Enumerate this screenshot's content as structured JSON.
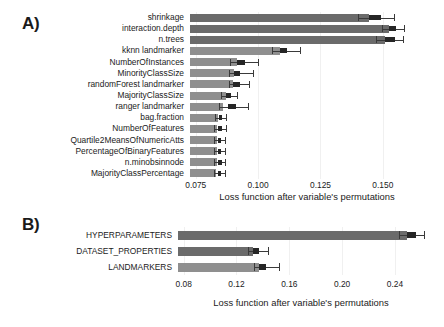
{
  "figure": {
    "background": "#ffffff",
    "panels": [
      "A)",
      "B)"
    ]
  },
  "panelA": {
    "letter": "A)",
    "xlabel": "Loss function after variable's permutations",
    "ticks": [
      "0.075",
      "0.100",
      "0.125",
      "0.150"
    ],
    "tickvals": [
      0.075,
      0.1,
      0.125,
      0.15
    ],
    "labels": [
      "shrinkage",
      "interaction.depth",
      "n.trees",
      "kknn landmarker",
      "NumberOfInstances",
      "MinorityClassSize",
      "randomForest landmarker",
      "MajorityClassSize",
      "ranger landmarker",
      "bag.fraction",
      "NumberOfFeatures",
      "Quartile2MeansOfNumericAtts",
      "PercentageOfBinaryFeatures",
      "n.minobsinnode",
      "MajorityClassPercentage"
    ]
  },
  "panelB": {
    "letter": "B)",
    "xlabel": "Loss function after variable's permutations",
    "ticks": [
      "0.08",
      "0.12",
      "0.16",
      "0.20",
      "0.24"
    ],
    "tickvals": [
      0.08,
      0.12,
      0.16,
      0.2,
      0.24
    ],
    "labels": [
      "HYPERPARAMETERS",
      "DATASET_PROPERTIES",
      "LANDMARKERS"
    ]
  },
  "colors": {
    "bar_dark": "#6b6b6b",
    "bar_light": "#8f8f8f",
    "box": "#262626",
    "whisker": "#3a3a3a",
    "grid": "#f0f0f0",
    "text": "#1b1b1b"
  },
  "chart_data": [
    {
      "type": "bar",
      "orientation": "horizontal",
      "title": "A)",
      "xlabel": "Loss function after variable's permutations",
      "ylabel": "",
      "xlim": [
        0.0727,
        0.1665
      ],
      "grid": true,
      "legend": null,
      "categories": [
        "shrinkage",
        "interaction.depth",
        "n.trees",
        "kknn landmarker",
        "NumberOfInstances",
        "MinorityClassSize",
        "randomForest landmarker",
        "MajorityClassSize",
        "ranger landmarker",
        "bag.fraction",
        "NumberOfFeatures",
        "Quartile2MeansOfNumericAtts",
        "PercentageOfBinaryFeatures",
        "n.minobsinnode",
        "MajorityClassPercentage"
      ],
      "values": [
        0.1446,
        0.1525,
        0.1509,
        0.1086,
        0.0916,
        0.0903,
        0.0901,
        0.087,
        0.086,
        0.0838,
        0.0836,
        0.0835,
        0.0834,
        0.0834,
        0.0833
      ],
      "box_low": [
        0.1446,
        0.1525,
        0.1509,
        0.1086,
        0.0916,
        0.0903,
        0.0901,
        0.087,
        0.088,
        0.0843,
        0.0841,
        0.084,
        0.0839,
        0.084,
        0.0839
      ],
      "box_high": [
        0.1493,
        0.1553,
        0.1548,
        0.1117,
        0.0949,
        0.0928,
        0.0928,
        0.0892,
        0.0913,
        0.0856,
        0.0854,
        0.0852,
        0.0852,
        0.0854,
        0.0853
      ],
      "whisker_low": [
        0.1399,
        0.1498,
        0.1474,
        0.1056,
        0.0886,
        0.0884,
        0.0884,
        0.0853,
        0.0845,
        0.0826,
        0.0825,
        0.0824,
        0.0824,
        0.0824,
        0.0823
      ],
      "whisker_high": [
        0.1545,
        0.1583,
        0.1579,
        0.1166,
        0.0999,
        0.0978,
        0.0963,
        0.0914,
        0.0958,
        0.0872,
        0.087,
        0.0867,
        0.0866,
        0.0868,
        0.0867
      ],
      "bar_group": [
        "dark",
        "dark",
        "dark",
        "light",
        "light",
        "light",
        "light",
        "light",
        "light",
        "light",
        "light",
        "light",
        "light",
        "light",
        "light"
      ]
    },
    {
      "type": "bar",
      "orientation": "horizontal",
      "title": "B)",
      "xlabel": "Loss function after variable's permutations",
      "ylabel": "",
      "xlim": [
        0.0757,
        0.262
      ],
      "grid": true,
      "legend": null,
      "categories": [
        "HYPERPARAMETERS",
        "DATASET_PROPERTIES",
        "LANDMARKERS"
      ],
      "values": [
        0.249,
        0.1325,
        0.137
      ],
      "box_low": [
        0.249,
        0.1325,
        0.137
      ],
      "box_high": [
        0.2556,
        0.1372,
        0.142
      ],
      "whisker_low": [
        0.243,
        0.129,
        0.133
      ],
      "whisker_high": [
        0.262,
        0.1435,
        0.152
      ],
      "bar_group": [
        "dark",
        "dark",
        "light"
      ]
    }
  ]
}
